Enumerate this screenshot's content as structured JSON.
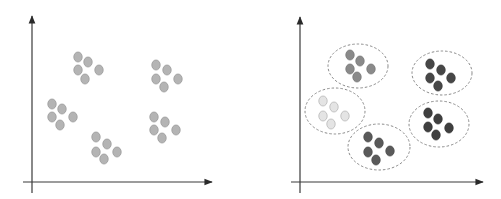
{
  "diagram": {
    "type": "clustering-before-after",
    "colors": {
      "axis": "#3a3a3a",
      "unclustered_point_fill": "#b4b4b4",
      "unclustered_point_stroke": "#9a9a9a",
      "ellipse_stroke": "#8a8a8a"
    },
    "left_panel": {
      "label": "unclustered-data",
      "axes": {
        "origin": [
          32,
          182
        ],
        "y_top": 16,
        "y_bottom": 193,
        "x_left": 23,
        "x_right": 212
      },
      "clusters": [
        {
          "points": [
            [
              78,
              57
            ],
            [
              88,
              62
            ],
            [
              78,
              70
            ],
            [
              85,
              79
            ],
            [
              99,
              70
            ]
          ]
        },
        {
          "points": [
            [
              156,
              65
            ],
            [
              167,
              70
            ],
            [
              156,
              79
            ],
            [
              164,
              87
            ],
            [
              178,
              79
            ]
          ]
        },
        {
          "points": [
            [
              52,
              104
            ],
            [
              62,
              109
            ],
            [
              52,
              117
            ],
            [
              60,
              125
            ],
            [
              73,
              117
            ]
          ]
        },
        {
          "points": [
            [
              154,
              117
            ],
            [
              165,
              122
            ],
            [
              154,
              130
            ],
            [
              162,
              138
            ],
            [
              176,
              130
            ]
          ]
        },
        {
          "points": [
            [
              96,
              137
            ],
            [
              107,
              144
            ],
            [
              96,
              152
            ],
            [
              104,
              159
            ],
            [
              117,
              152
            ]
          ]
        }
      ]
    },
    "right_panel": {
      "label": "clustered-data",
      "axes": {
        "origin": [
          300,
          182
        ],
        "y_top": 17,
        "y_bottom": 193,
        "x_left": 291,
        "x_right": 483
      },
      "clusters": [
        {
          "fill": "#8a8a8a",
          "stroke": "#777777",
          "ellipse": {
            "cx": 358,
            "cy": 66,
            "rx": 30,
            "ry": 22
          },
          "points": [
            [
              350,
              55
            ],
            [
              360,
              61
            ],
            [
              350,
              69
            ],
            [
              357,
              77
            ],
            [
              371,
              69
            ]
          ]
        },
        {
          "fill": "#474747",
          "stroke": "#3a3a3a",
          "ellipse": {
            "cx": 442,
            "cy": 73,
            "rx": 30,
            "ry": 22
          },
          "points": [
            [
              430,
              64
            ],
            [
              441,
              70
            ],
            [
              430,
              78
            ],
            [
              438,
              86
            ],
            [
              451,
              78
            ]
          ]
        },
        {
          "fill": "#e4e4e4",
          "stroke": "#b8b8b8",
          "ellipse": {
            "cx": 335,
            "cy": 111,
            "rx": 30,
            "ry": 23
          },
          "points": [
            [
              323,
              101
            ],
            [
              334,
              107
            ],
            [
              323,
              116
            ],
            [
              331,
              124
            ],
            [
              345,
              116
            ]
          ]
        },
        {
          "fill": "#3f3f3f",
          "stroke": "#333333",
          "ellipse": {
            "cx": 439,
            "cy": 124,
            "rx": 30,
            "ry": 23
          },
          "points": [
            [
              428,
              113
            ],
            [
              438,
              119
            ],
            [
              428,
              127
            ],
            [
              436,
              135
            ],
            [
              449,
              128
            ]
          ]
        },
        {
          "fill": "#5a5a5a",
          "stroke": "#4a4a4a",
          "ellipse": {
            "cx": 379,
            "cy": 147,
            "rx": 31,
            "ry": 23
          },
          "points": [
            [
              368,
              137
            ],
            [
              379,
              143
            ],
            [
              368,
              152
            ],
            [
              376,
              160
            ],
            [
              390,
              151
            ]
          ]
        }
      ]
    }
  }
}
